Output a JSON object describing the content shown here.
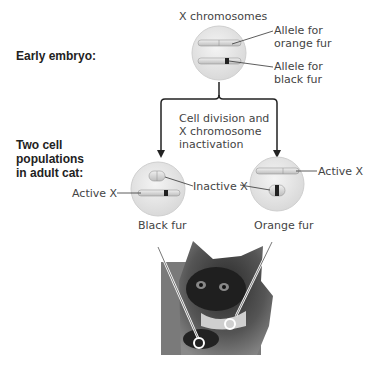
{
  "left_labels": {
    "stage1": "Early embryo:",
    "stage2_line1": "Two cell",
    "stage2_line2": "populations",
    "stage2_line3": "in adult cat:"
  },
  "embryo_cell": {
    "title": "X chromosomes",
    "allele_orange_line1": "Allele for",
    "allele_orange_line2": "orange fur",
    "allele_black_line1": "Allele for",
    "allele_black_line2": "black fur"
  },
  "process": {
    "line1": "Cell division and",
    "line2": "X chromosome",
    "line3": "inactivation"
  },
  "left_cell": {
    "active_label": "Active X",
    "inactive_label": "Inactive X",
    "result": "Black fur"
  },
  "right_cell": {
    "active_label": "Active X",
    "inactive_label": "Inactive X",
    "result": "Orange fur"
  },
  "photo": {
    "subject": "tortoiseshell kitten"
  },
  "colors": {
    "cell_fill": "#e8e8e8",
    "cell_edge": "#cfcfcf",
    "chromosome": "#d4d4d4",
    "band_dark": "#222222",
    "line": "#333333"
  }
}
